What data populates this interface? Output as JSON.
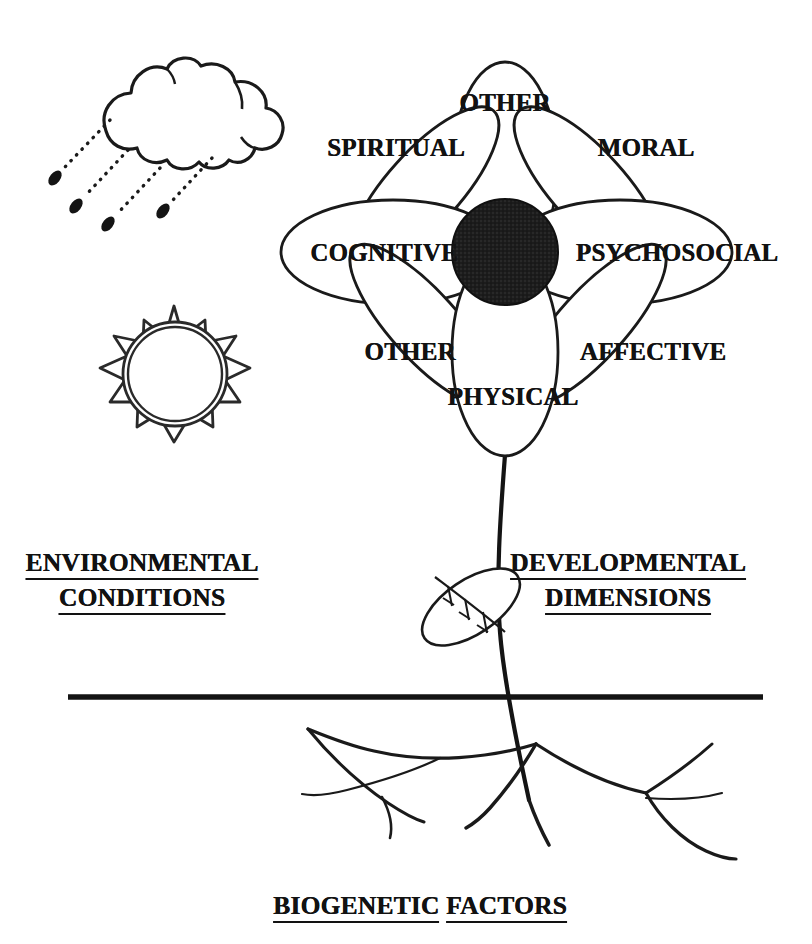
{
  "diagram": {
    "title": "BIOGENETIC FACTORS",
    "background_color": "#ffffff",
    "ink_color": "#121212"
  },
  "flower": {
    "center_label": "",
    "center_fill": "#1c1c1c",
    "petals": [
      {
        "id": "other-top",
        "label": "OTHER"
      },
      {
        "id": "spiritual",
        "label": "SPIRITUAL"
      },
      {
        "id": "moral",
        "label": "MORAL"
      },
      {
        "id": "cognitive",
        "label": "COGNITIVE"
      },
      {
        "id": "psychosocial",
        "label": "PSYCHOSOCIAL"
      },
      {
        "id": "other-bottom",
        "label": "OTHER"
      },
      {
        "id": "affective",
        "label": "AFFECTIVE"
      },
      {
        "id": "physical",
        "label": "PHYSICAL"
      }
    ]
  },
  "sections": {
    "environment": {
      "line1": "ENVIRONMENTAL",
      "line2": "CONDITIONS"
    },
    "development": {
      "line1": "DEVELOPMENTAL",
      "line2": "DIMENSIONS"
    },
    "biogenetic": {
      "word1": "BIOGENETIC",
      "word2": "FACTORS"
    }
  },
  "icons": {
    "cloud": "rain-cloud-icon",
    "sun": "sun-icon",
    "leaf": "leaf-icon",
    "roots": "roots-icon",
    "ground": "ground-line"
  }
}
